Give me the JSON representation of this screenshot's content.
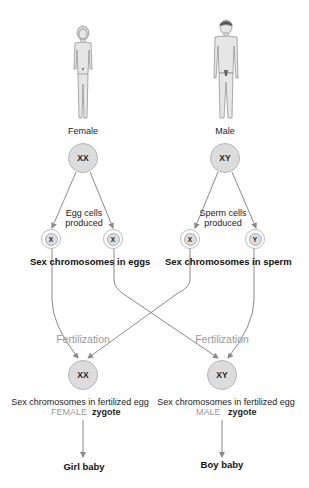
{
  "parents": {
    "female": {
      "label": "Female",
      "chromosomes": "XX"
    },
    "male": {
      "label": "Male",
      "chromosomes": "XY"
    }
  },
  "gametes": {
    "eggs": {
      "caption": "Egg cells produced",
      "caption_line1": "Egg cells",
      "caption_line2": "produced",
      "cells": [
        "X",
        "X"
      ],
      "heading": "Sex chromosomes in eggs"
    },
    "sperm": {
      "caption": "Sperm cells produced",
      "caption_line1": "Sperm cells",
      "caption_line2": "produced",
      "cells": [
        "X",
        "Y"
      ],
      "heading": "Sex chromosomes in sperm"
    }
  },
  "fertilization": {
    "left": {
      "label": "Fertilization",
      "zygote": "XX",
      "caption": "Sex chromosomes in fertilized egg",
      "sex": "FEMALE",
      "zygote_word": "zygote",
      "outcome": "Girl baby"
    },
    "right": {
      "label": "Fertilization",
      "zygote": "XY",
      "caption": "Sex chromosomes in fertilized egg",
      "sex": "MALE",
      "zygote_word": "zygote",
      "outcome": "Boy baby"
    }
  },
  "colors": {
    "line": "#8a8a8a",
    "circle_fill": "#dcdcdc",
    "muted_text": "#999999"
  }
}
